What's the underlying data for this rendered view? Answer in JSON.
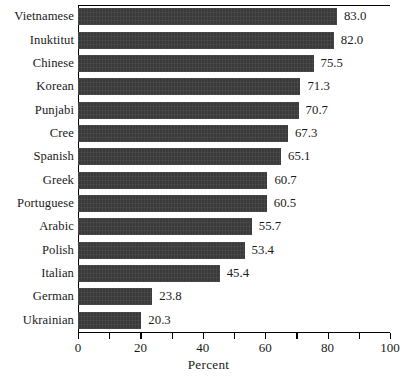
{
  "chart_data": {
    "type": "bar",
    "orientation": "horizontal",
    "title": "",
    "xlabel": "Percent",
    "ylabel": "",
    "xlim": [
      0,
      100
    ],
    "xticks": [
      0,
      20,
      40,
      60,
      80,
      100
    ],
    "xtick_labels": [
      "0",
      "20",
      "40",
      "60",
      "80",
      "100"
    ],
    "minor_tick_step": 10,
    "grid": false,
    "legend": false,
    "bar_color": "#3a3a3a",
    "categories": [
      "Vietnamese",
      "Inuktitut",
      "Chinese",
      "Korean",
      "Punjabi",
      "Cree",
      "Spanish",
      "Greek",
      "Portuguese",
      "Arabic",
      "Polish",
      "Italian",
      "German",
      "Ukrainian"
    ],
    "values": [
      83.0,
      82.0,
      75.5,
      71.3,
      70.7,
      67.3,
      65.1,
      60.7,
      60.5,
      55.7,
      53.4,
      45.4,
      23.8,
      20.3
    ],
    "value_labels": [
      "83.0",
      "82.0",
      "75.5",
      "71.3",
      "70.7",
      "67.3",
      "65.1",
      "60.7",
      "60.5",
      "55.7",
      "53.4",
      "45.4",
      "23.8",
      "20.3"
    ]
  }
}
